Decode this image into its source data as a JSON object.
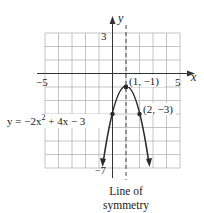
{
  "figure": {
    "x_axis_label": "x",
    "y_axis_label": "y",
    "tick_labels": {
      "x_min": "−5",
      "x_max": "5",
      "y_max": "3",
      "y_min": "−7"
    },
    "equation": "y = −2x² + 4x − 3",
    "equation_parts": {
      "prefix": "y = −2x",
      "exp": "2",
      "suffix": " + 4x − 3"
    },
    "points": [
      {
        "label": "(1, −1)",
        "x": 1,
        "y": -1
      },
      {
        "label": "(2, −3)",
        "x": 2,
        "y": -3
      },
      {
        "x": 0,
        "y": -3
      }
    ],
    "symmetry_caption_line1": "Line of",
    "symmetry_caption_line2": "symmetry",
    "axis_of_symmetry": 1,
    "grid": {
      "xmin": -5,
      "xmax": 5,
      "ymin": -7,
      "ymax": 3
    },
    "colors": {
      "grid": "#b5b5b5",
      "axis": "#333333",
      "curve": "#2a2a2a"
    }
  }
}
